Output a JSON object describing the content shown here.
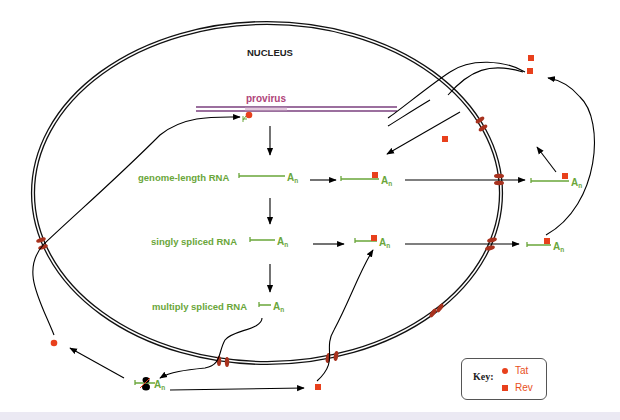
{
  "diagram": {
    "title": "NUCLEUS",
    "provirus_label": "provirus",
    "rna_species": [
      {
        "id": "genome",
        "label": "genome-length RNA",
        "tail": "A",
        "tail_sub": "n"
      },
      {
        "id": "singly",
        "label": "singly spliced RNA",
        "tail": "A",
        "tail_sub": "n"
      },
      {
        "id": "multiply",
        "label": "multiply spliced RNA",
        "tail": "A",
        "tail_sub": "n"
      }
    ],
    "polyA": {
      "main": "A",
      "sub": "n"
    },
    "key": {
      "title": "Key:",
      "items": [
        {
          "symbol": "circle",
          "label": "Tat"
        },
        {
          "symbol": "square",
          "label": "Rev"
        }
      ]
    },
    "colors": {
      "rna_green": "#6aa63a",
      "protein_red": "#e8401c",
      "pore_brown": "#a8321e",
      "provirus_purple": "#7a3f7e",
      "provirus_label": "#b0457a",
      "membrane": "#111111"
    }
  }
}
